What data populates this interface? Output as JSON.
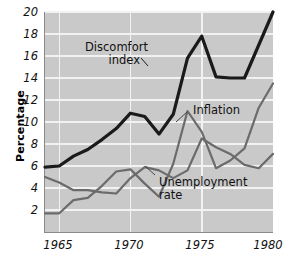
{
  "chart_data": {
    "type": "line",
    "title": "",
    "xlabel": "",
    "ylabel": "Percentage",
    "xlim": [
      1964,
      1980
    ],
    "ylim": [
      0,
      20
    ],
    "grid": true,
    "legend_position": "inline-annotations",
    "x": [
      1964,
      1965,
      1966,
      1967,
      1968,
      1969,
      1970,
      1971,
      1972,
      1973,
      1974,
      1975,
      1976,
      1977,
      1978,
      1979,
      1980
    ],
    "xticks": [
      1965,
      1970,
      1975,
      1980
    ],
    "yticks": [
      0,
      2,
      4,
      6,
      8,
      10,
      12,
      14,
      16,
      18,
      20
    ],
    "series": [
      {
        "name": "Discomfort index",
        "color": "#1a1a1a",
        "values": [
          5.9,
          6.0,
          6.9,
          7.5,
          8.4,
          9.4,
          10.8,
          10.5,
          8.9,
          10.7,
          15.8,
          17.8,
          14.1,
          14.0,
          14.0,
          17.0,
          20.0
        ]
      },
      {
        "name": "Inflation",
        "color": "#6b6b6b",
        "values": [
          1.7,
          1.7,
          2.9,
          3.1,
          4.2,
          5.5,
          5.7,
          4.4,
          3.2,
          6.2,
          11.0,
          9.1,
          5.8,
          6.5,
          7.6,
          11.3,
          13.5
        ]
      },
      {
        "name": "Unemployment rate",
        "color": "#6b6b6b",
        "values": [
          5.0,
          4.5,
          3.8,
          3.8,
          3.6,
          3.5,
          4.9,
          5.9,
          5.6,
          4.9,
          5.6,
          8.5,
          7.7,
          7.1,
          6.1,
          5.8,
          7.1
        ]
      }
    ],
    "annotations": [
      {
        "name": "discomfort-index",
        "text_line1": "Discomfort",
        "text_line2": "index"
      },
      {
        "name": "inflation",
        "text_line1": "Inflation",
        "text_line2": ""
      },
      {
        "name": "unemployment-rate",
        "text_line1": "Unemployment",
        "text_line2": "rate"
      }
    ]
  },
  "axis": {
    "y_title": "Percentage",
    "y_ticks": [
      "20",
      "18",
      "16",
      "14",
      "12",
      "10",
      "8",
      "6",
      "4",
      "2"
    ],
    "x_ticks": [
      "1965",
      "1970",
      "1975",
      "1980"
    ]
  },
  "annotations": {
    "discomfort_line1": "Discomfort",
    "discomfort_line2": "index",
    "inflation": "Inflation",
    "unemployment_line1": "Unemployment",
    "unemployment_line2": "rate"
  },
  "colors": {
    "plot_background": "#c9c9c9",
    "gridline": "#f2f2f2",
    "discomfort": "#1a1a1a",
    "inflation": "#6b6b6b",
    "unemployment": "#6b6b6b",
    "axis": "#8a8a8a"
  }
}
